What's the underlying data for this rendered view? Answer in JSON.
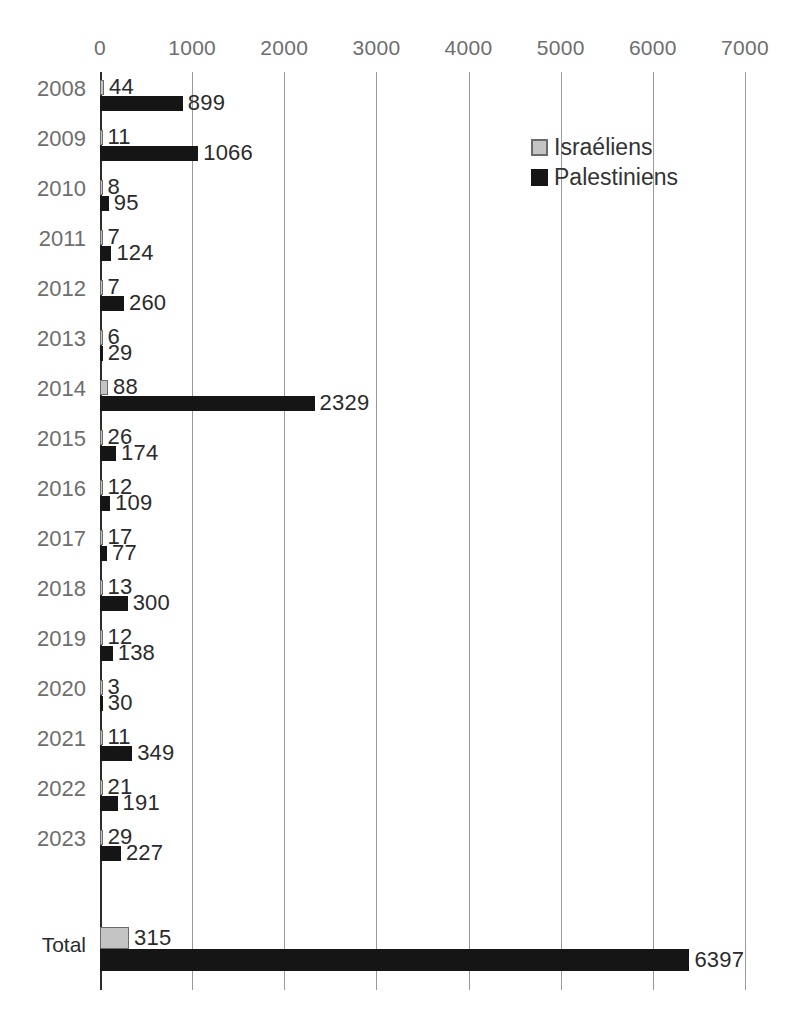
{
  "chart_data": {
    "type": "bar",
    "orientation": "horizontal",
    "title": "",
    "subtitle": "",
    "xlabel": "",
    "ylabel": "",
    "xlim": [
      0,
      7000
    ],
    "x_ticks": [
      0,
      1000,
      2000,
      3000,
      4000,
      5000,
      6000,
      7000
    ],
    "x_tick_labels": [
      "0",
      "1000",
      "2000",
      "3000",
      "4000",
      "5000",
      "6000",
      "7000"
    ],
    "grid": true,
    "legend_position": "upper-right",
    "categories": [
      "2008",
      "2009",
      "2010",
      "2011",
      "2012",
      "2013",
      "2014",
      "2015",
      "2016",
      "2017",
      "2018",
      "2019",
      "2020",
      "2021",
      "2022",
      "2023",
      "Total"
    ],
    "series": [
      {
        "name": "Israéliens",
        "color": "#c4c4c4",
        "values": [
          44,
          11,
          8,
          7,
          7,
          6,
          88,
          26,
          12,
          17,
          13,
          12,
          3,
          11,
          21,
          29,
          315
        ]
      },
      {
        "name": "Palestiniens",
        "color": "#151515",
        "values": [
          899,
          1066,
          95,
          124,
          260,
          29,
          2329,
          174,
          109,
          77,
          300,
          138,
          30,
          349,
          191,
          227,
          6397
        ]
      }
    ],
    "data_labels": true
  },
  "legend": {
    "items": [
      {
        "label": "Israéliens",
        "swatch": "israeli"
      },
      {
        "label": "Palestiniens",
        "swatch": "palestinian"
      }
    ]
  },
  "colors": {
    "israeli": "#c4c4c4",
    "israeli_border": "#6b6b6b",
    "palestinian": "#151515",
    "gridline": "#9a9a9a",
    "axis": "#2b2b2b",
    "tick_text": "#6e6e6e",
    "value_text": "#2b2b2b",
    "background": "#ffffff"
  }
}
